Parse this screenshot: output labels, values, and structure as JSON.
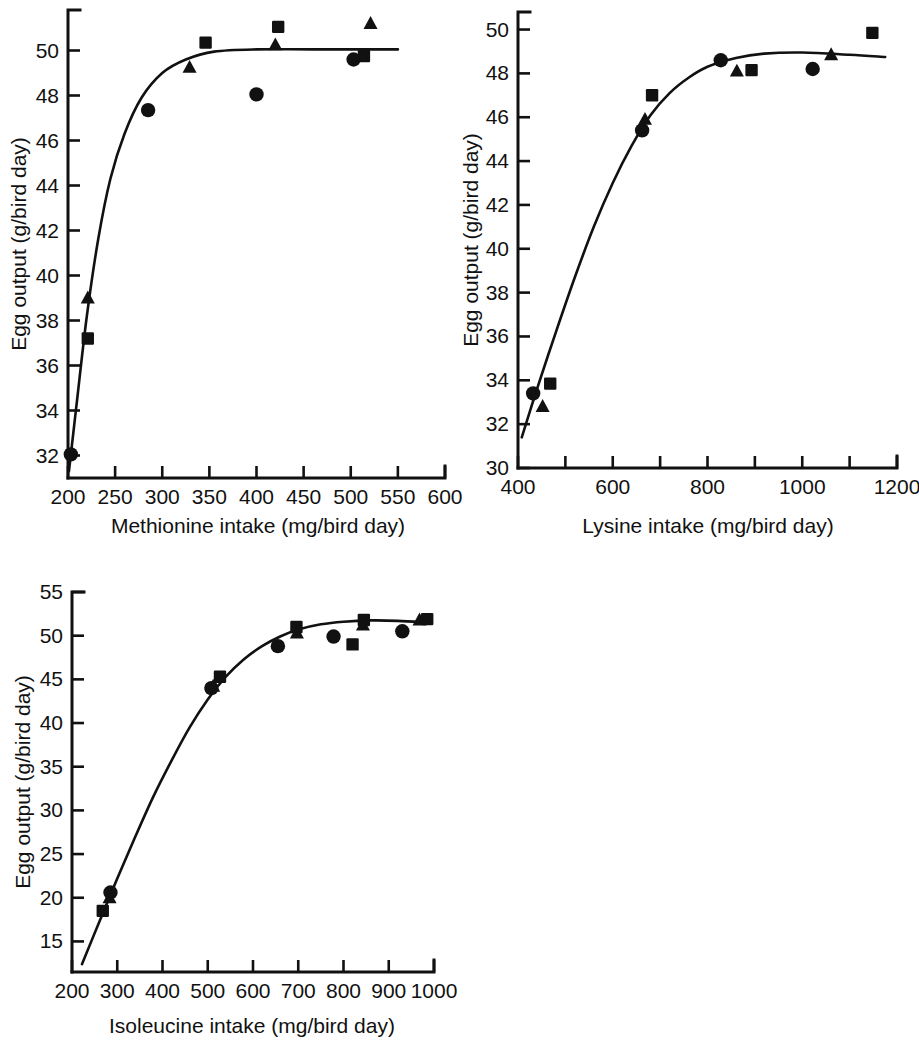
{
  "figure": {
    "background_color": "#ffffff",
    "ink_color": "#111111",
    "panel_count": 3
  },
  "chart_data": [
    {
      "type": "scatter",
      "id": "methionine-panel",
      "title": "",
      "xlabel": "Methionine intake (mg/bird day)",
      "ylabel": "Egg output (g/bird day)",
      "xlim": [
        200,
        600
      ],
      "ylim": [
        31,
        51.8
      ],
      "xticks": [
        200,
        250,
        300,
        350,
        400,
        450,
        500,
        550,
        600
      ],
      "xticklabels": [
        "200",
        "250",
        "300",
        "350",
        "400",
        "450",
        "500",
        "550",
        "600"
      ],
      "yticks": [
        32,
        34,
        36,
        38,
        40,
        42,
        44,
        46,
        48,
        50
      ],
      "yticklabels": [
        "32",
        "34",
        "36",
        "38",
        "40",
        "42",
        "44",
        "46",
        "48",
        "50"
      ],
      "grid": false,
      "legend": "none",
      "series": [
        {
          "name": "circle",
          "marker": "circle",
          "points": [
            {
              "x": 203,
              "y": 32.05
            },
            {
              "x": 285,
              "y": 47.35
            },
            {
              "x": 400,
              "y": 48.05
            },
            {
              "x": 503,
              "y": 49.6
            }
          ]
        },
        {
          "name": "square",
          "marker": "square",
          "points": [
            {
              "x": 221,
              "y": 37.2
            },
            {
              "x": 346,
              "y": 50.35
            },
            {
              "x": 423,
              "y": 51.05
            },
            {
              "x": 514,
              "y": 49.75
            }
          ]
        },
        {
          "name": "triangle",
          "marker": "triangle",
          "points": [
            {
              "x": 221,
              "y": 39.0
            },
            {
              "x": 329,
              "y": 49.25
            },
            {
              "x": 420,
              "y": 50.25
            },
            {
              "x": 521,
              "y": 51.2
            }
          ]
        }
      ],
      "fit_curve": {
        "description": "saturating response curve",
        "points": [
          {
            "x": 201,
            "y": 31.3
          },
          {
            "x": 210,
            "y": 34.6
          },
          {
            "x": 220,
            "y": 38.2
          },
          {
            "x": 232,
            "y": 41.6
          },
          {
            "x": 245,
            "y": 44.3
          },
          {
            "x": 260,
            "y": 46.3
          },
          {
            "x": 278,
            "y": 47.9
          },
          {
            "x": 300,
            "y": 49.0
          },
          {
            "x": 325,
            "y": 49.6
          },
          {
            "x": 355,
            "y": 49.95
          },
          {
            "x": 400,
            "y": 50.05
          },
          {
            "x": 460,
            "y": 50.05
          },
          {
            "x": 550,
            "y": 50.05
          }
        ]
      }
    },
    {
      "type": "scatter",
      "id": "lysine-panel",
      "title": "",
      "xlabel": "Lysine intake (mg/bird day)",
      "ylabel": "Egg output (g/bird day)",
      "xlim": [
        400,
        1200
      ],
      "ylim": [
        30,
        50.8
      ],
      "xticks": [
        400,
        500,
        600,
        700,
        800,
        900,
        1000,
        1100,
        1200
      ],
      "xticklabels": [
        "400",
        "",
        "600",
        "",
        "800",
        "",
        "1000",
        "",
        "1200"
      ],
      "yticks": [
        30,
        32,
        34,
        36,
        38,
        40,
        42,
        44,
        46,
        48,
        50
      ],
      "yticklabels": [
        "30",
        "32",
        "34",
        "36",
        "38",
        "40",
        "42",
        "44",
        "46",
        "48",
        "50"
      ],
      "grid": false,
      "legend": "none",
      "series": [
        {
          "name": "circle",
          "marker": "circle",
          "points": [
            {
              "x": 432,
              "y": 33.4
            },
            {
              "x": 662,
              "y": 45.4
            },
            {
              "x": 828,
              "y": 48.6
            },
            {
              "x": 1022,
              "y": 48.2
            }
          ]
        },
        {
          "name": "square",
          "marker": "square",
          "points": [
            {
              "x": 468,
              "y": 33.85
            },
            {
              "x": 683,
              "y": 47.0
            },
            {
              "x": 893,
              "y": 48.15
            },
            {
              "x": 1148,
              "y": 49.85
            }
          ]
        },
        {
          "name": "triangle",
          "marker": "triangle",
          "points": [
            {
              "x": 452,
              "y": 32.8
            },
            {
              "x": 668,
              "y": 45.9
            },
            {
              "x": 862,
              "y": 48.1
            },
            {
              "x": 1061,
              "y": 48.85
            }
          ]
        }
      ],
      "fit_curve": {
        "description": "saturating response curve",
        "points": [
          {
            "x": 408,
            "y": 31.4
          },
          {
            "x": 440,
            "y": 33.6
          },
          {
            "x": 480,
            "y": 36.2
          },
          {
            "x": 520,
            "y": 38.7
          },
          {
            "x": 560,
            "y": 41.0
          },
          {
            "x": 600,
            "y": 43.0
          },
          {
            "x": 640,
            "y": 44.7
          },
          {
            "x": 680,
            "y": 46.1
          },
          {
            "x": 720,
            "y": 47.1
          },
          {
            "x": 760,
            "y": 47.8
          },
          {
            "x": 800,
            "y": 48.3
          },
          {
            "x": 860,
            "y": 48.7
          },
          {
            "x": 920,
            "y": 48.9
          },
          {
            "x": 1000,
            "y": 48.95
          },
          {
            "x": 1100,
            "y": 48.85
          },
          {
            "x": 1175,
            "y": 48.75
          }
        ]
      }
    },
    {
      "type": "scatter",
      "id": "isoleucine-panel",
      "title": "",
      "xlabel": "Isoleucine intake (mg/bird day)",
      "ylabel": "Egg output (g/bird day)",
      "xlim": [
        200,
        1000
      ],
      "ylim": [
        11.5,
        55
      ],
      "xticks": [
        200,
        300,
        400,
        500,
        600,
        700,
        800,
        900,
        1000
      ],
      "xticklabels": [
        "200",
        "300",
        "400",
        "500",
        "600",
        "700",
        "800",
        "900",
        "1000"
      ],
      "yticks": [
        15,
        20,
        25,
        30,
        35,
        40,
        45,
        50,
        55
      ],
      "yticklabels": [
        "15",
        "20",
        "25",
        "30",
        "35",
        "40",
        "45",
        "50",
        "55"
      ],
      "grid": false,
      "legend": "none",
      "series": [
        {
          "name": "circle",
          "marker": "circle",
          "points": [
            {
              "x": 285,
              "y": 20.6
            },
            {
              "x": 508,
              "y": 44.0
            },
            {
              "x": 655,
              "y": 48.8
            },
            {
              "x": 778,
              "y": 49.9
            },
            {
              "x": 930,
              "y": 50.5
            }
          ]
        },
        {
          "name": "square",
          "marker": "square",
          "points": [
            {
              "x": 268,
              "y": 18.5
            },
            {
              "x": 527,
              "y": 45.3
            },
            {
              "x": 696,
              "y": 51.0
            },
            {
              "x": 820,
              "y": 49.0
            },
            {
              "x": 845,
              "y": 51.8
            },
            {
              "x": 985,
              "y": 51.9
            }
          ]
        },
        {
          "name": "triangle",
          "marker": "triangle",
          "points": [
            {
              "x": 283,
              "y": 20.0
            },
            {
              "x": 512,
              "y": 44.2
            },
            {
              "x": 697,
              "y": 50.3
            },
            {
              "x": 843,
              "y": 51.2
            },
            {
              "x": 968,
              "y": 51.8
            }
          ]
        }
      ],
      "fit_curve": {
        "description": "saturating response curve",
        "points": [
          {
            "x": 222,
            "y": 12.4
          },
          {
            "x": 260,
            "y": 17.2
          },
          {
            "x": 300,
            "y": 22.2
          },
          {
            "x": 340,
            "y": 27.0
          },
          {
            "x": 380,
            "y": 31.6
          },
          {
            "x": 420,
            "y": 35.7
          },
          {
            "x": 460,
            "y": 39.5
          },
          {
            "x": 500,
            "y": 42.7
          },
          {
            "x": 540,
            "y": 45.3
          },
          {
            "x": 580,
            "y": 47.3
          },
          {
            "x": 620,
            "y": 48.8
          },
          {
            "x": 660,
            "y": 49.9
          },
          {
            "x": 700,
            "y": 50.7
          },
          {
            "x": 750,
            "y": 51.3
          },
          {
            "x": 800,
            "y": 51.6
          },
          {
            "x": 860,
            "y": 51.75
          },
          {
            "x": 920,
            "y": 51.7
          },
          {
            "x": 985,
            "y": 51.5
          }
        ]
      }
    }
  ]
}
